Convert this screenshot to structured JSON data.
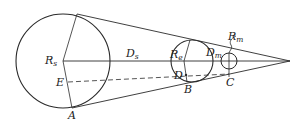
{
  "diagram": {
    "type": "eclipse-geometry",
    "colors": {
      "line": "#2a2a2a",
      "background": "#ffffff",
      "text": "#222222"
    },
    "bodies": [
      {
        "id": "sun",
        "radius_label": {
          "main": "R",
          "sub": "s"
        },
        "cx": 63,
        "cy": 61,
        "r": 47
      },
      {
        "id": "earth",
        "radius_label": {
          "main": "R",
          "sub": "e"
        },
        "cx": 192,
        "cy": 61,
        "r": 21
      },
      {
        "id": "moon",
        "radius_label": {
          "main": "R",
          "sub": "m"
        },
        "cx": 229,
        "cy": 61,
        "r": 8
      }
    ],
    "distances": [
      {
        "id": "sun-earth",
        "label": {
          "main": "D",
          "sub": "s"
        }
      },
      {
        "id": "earth-moon",
        "label": {
          "main": "D",
          "sub": "m"
        }
      }
    ],
    "points": {
      "A": "A",
      "B": "B",
      "C": "C",
      "D": "D",
      "E": "E"
    }
  }
}
